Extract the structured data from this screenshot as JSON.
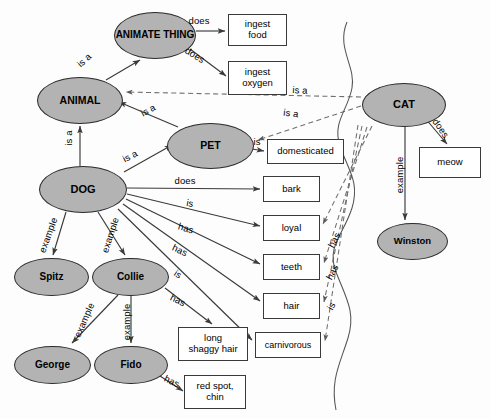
{
  "diagram": {
    "colors": {
      "node_fill": "#b3b3b3",
      "node_stroke": "#2b2b2b",
      "box_fill": "#ffffff",
      "box_stroke": "#3a3a3a",
      "edge": "#3a3a3a",
      "inherited_edge": "#6e6e6e",
      "background": "#fdfdfd",
      "boundary": "#555555"
    },
    "concept_nodes": [
      {
        "id": "animate_thing",
        "label": "ANIMATE THING",
        "x": 114,
        "y": 12,
        "w": 82,
        "h": 47
      },
      {
        "id": "animal",
        "label": "ANIMAL",
        "x": 37,
        "y": 77,
        "w": 86,
        "h": 47
      },
      {
        "id": "pet",
        "label": "PET",
        "x": 167,
        "y": 123,
        "w": 87,
        "h": 46
      },
      {
        "id": "dog",
        "label": "DOG",
        "x": 39,
        "y": 166,
        "w": 88,
        "h": 47
      },
      {
        "id": "cat",
        "label": "CAT",
        "x": 362,
        "y": 83,
        "w": 84,
        "h": 44
      },
      {
        "id": "spitz",
        "label": "Spitz",
        "x": 14,
        "y": 258,
        "w": 75,
        "h": 38
      },
      {
        "id": "collie",
        "label": "Collie",
        "x": 92,
        "y": 258,
        "w": 77,
        "h": 38
      },
      {
        "id": "george",
        "label": "George",
        "x": 14,
        "y": 346,
        "w": 77,
        "h": 38
      },
      {
        "id": "fido",
        "label": "Fido",
        "x": 94,
        "y": 346,
        "w": 74,
        "h": 38
      },
      {
        "id": "winston",
        "label": "Winston",
        "x": 377,
        "y": 223,
        "w": 71,
        "h": 37
      }
    ],
    "property_boxes": [
      {
        "id": "ingest_food",
        "label": "ingest food",
        "lines": [
          "ingest",
          "food"
        ],
        "x": 228,
        "y": 14,
        "w": 59,
        "h": 32
      },
      {
        "id": "ingest_oxygen",
        "label": "ingest oxygen",
        "lines": [
          "ingest",
          "oxygen"
        ],
        "x": 228,
        "y": 61,
        "w": 59,
        "h": 34
      },
      {
        "id": "domesticated",
        "label": "domesticated",
        "lines": [
          "domesticated"
        ],
        "x": 267,
        "y": 139,
        "w": 77,
        "h": 25
      },
      {
        "id": "bark",
        "label": "bark",
        "lines": [
          "bark"
        ],
        "x": 263,
        "y": 176,
        "w": 57,
        "h": 26
      },
      {
        "id": "loyal",
        "label": "loyal",
        "lines": [
          "loyal"
        ],
        "x": 263,
        "y": 215,
        "w": 57,
        "h": 26
      },
      {
        "id": "teeth",
        "label": "teeth",
        "lines": [
          "teeth"
        ],
        "x": 263,
        "y": 254,
        "w": 57,
        "h": 26
      },
      {
        "id": "hair",
        "label": "hair",
        "lines": [
          "hair"
        ],
        "x": 263,
        "y": 293,
        "w": 57,
        "h": 26
      },
      {
        "id": "carnivorous",
        "label": "carnivorous",
        "lines": [
          "carnivorous"
        ],
        "x": 255,
        "y": 332,
        "w": 66,
        "h": 26
      },
      {
        "id": "long_shaggy",
        "label": "long shaggy hair",
        "lines": [
          "long",
          "shaggy hair"
        ],
        "x": 178,
        "y": 327,
        "w": 70,
        "h": 34
      },
      {
        "id": "red_spot",
        "label": "red spot, chin",
        "lines": [
          "red spot,",
          "chin"
        ],
        "x": 184,
        "y": 375,
        "w": 62,
        "h": 34
      },
      {
        "id": "meow",
        "label": "meow",
        "lines": [
          "meow"
        ],
        "x": 419,
        "y": 147,
        "w": 62,
        "h": 31
      }
    ],
    "edges": [
      {
        "id": "e1",
        "from": "animal",
        "to": "animate_thing",
        "label": "is a",
        "style": "solid",
        "lx": 84,
        "ly": 60,
        "rot": -42
      },
      {
        "id": "e2",
        "from": "animate_thing",
        "to": "ingest_food",
        "label": "does",
        "style": "solid",
        "lx": 199,
        "ly": 20,
        "rot": 0
      },
      {
        "id": "e3",
        "from": "animate_thing",
        "to": "ingest_oxygen",
        "label": "does",
        "style": "solid",
        "lx": 195,
        "ly": 55,
        "rot": 31
      },
      {
        "id": "e4",
        "from": "dog",
        "to": "animal",
        "label": "is a",
        "style": "solid",
        "lx": 68,
        "ly": 138,
        "rot": -90
      },
      {
        "id": "e5",
        "from": "dog",
        "to": "pet",
        "label": "is a",
        "style": "solid",
        "lx": 130,
        "ly": 156,
        "rot": -27
      },
      {
        "id": "e6",
        "from": "pet",
        "to": "animal",
        "label": "is a",
        "style": "solid",
        "lx": 148,
        "ly": 110,
        "rot": -28
      },
      {
        "id": "e7",
        "from": "pet",
        "to": "domesticated",
        "label": "is",
        "style": "solid",
        "lx": 257,
        "ly": 141,
        "rot": 0
      },
      {
        "id": "e8",
        "from": "cat",
        "to": "animal",
        "label": "is a",
        "style": "dashed",
        "lx": 300,
        "ly": 90,
        "rot": 3
      },
      {
        "id": "e9",
        "from": "cat",
        "to": "pet",
        "label": "is a",
        "style": "dashed",
        "lx": 291,
        "ly": 113,
        "rot": 7
      },
      {
        "id": "e10",
        "from": "cat",
        "to": "meow",
        "label": "does",
        "style": "solid",
        "lx": 441,
        "ly": 128,
        "rot": 55
      },
      {
        "id": "e11",
        "from": "cat",
        "to": "winston",
        "label": "example",
        "style": "solid",
        "lx": 399,
        "ly": 175,
        "rot": -90
      },
      {
        "id": "e12",
        "from": "dog",
        "to": "bark",
        "label": "does",
        "style": "solid",
        "lx": 185,
        "ly": 180,
        "rot": 0
      },
      {
        "id": "e13",
        "from": "dog",
        "to": "loyal",
        "label": "is",
        "style": "solid",
        "lx": 190,
        "ly": 203,
        "rot": 10
      },
      {
        "id": "e14",
        "from": "dog",
        "to": "teeth",
        "label": "has",
        "style": "solid",
        "lx": 186,
        "ly": 228,
        "rot": 17
      },
      {
        "id": "e15",
        "from": "dog",
        "to": "hair",
        "label": "has",
        "style": "solid",
        "lx": 180,
        "ly": 250,
        "rot": 25
      },
      {
        "id": "e16",
        "from": "dog",
        "to": "carnivorous",
        "label": "is",
        "style": "solid",
        "lx": 178,
        "ly": 274,
        "rot": 33
      },
      {
        "id": "e17",
        "from": "dog",
        "to": "spitz",
        "label": "example",
        "style": "solid",
        "lx": 48,
        "ly": 235,
        "rot": -70
      },
      {
        "id": "e18",
        "from": "dog",
        "to": "collie",
        "label": "example",
        "style": "solid",
        "lx": 110,
        "ly": 235,
        "rot": -72
      },
      {
        "id": "e19",
        "from": "collie",
        "to": "george",
        "label": "example",
        "style": "solid",
        "lx": 84,
        "ly": 320,
        "rot": -66
      },
      {
        "id": "e20",
        "from": "collie",
        "to": "fido",
        "label": "example",
        "style": "solid",
        "lx": 126,
        "ly": 322,
        "rot": -90
      },
      {
        "id": "e21",
        "from": "collie",
        "to": "long_shaggy",
        "label": "has",
        "style": "solid",
        "lx": 178,
        "ly": 300,
        "rot": 26
      },
      {
        "id": "e22",
        "from": "fido",
        "to": "red_spot",
        "label": "has",
        "style": "solid",
        "lx": 172,
        "ly": 381,
        "rot": 25
      },
      {
        "id": "e23",
        "from": "cat",
        "to": "loyal",
        "label": "has",
        "style": "dashed",
        "lx": 334,
        "ly": 240,
        "rot": -62
      },
      {
        "id": "e24",
        "from": "cat",
        "to": "teeth",
        "label": "has",
        "style": "dashed",
        "lx": 332,
        "ly": 272,
        "rot": -62
      },
      {
        "id": "e25",
        "from": "cat",
        "to": "hair",
        "label": "is",
        "style": "dashed",
        "lx": 331,
        "ly": 306,
        "rot": -62
      },
      {
        "id": "e26",
        "from": "cat",
        "to": "carnivorous",
        "label": "",
        "style": "dashed",
        "lx": 0,
        "ly": 0,
        "rot": 0
      }
    ],
    "boundary": {
      "id": "region-divider",
      "description": "wavy vertical separator line"
    }
  }
}
